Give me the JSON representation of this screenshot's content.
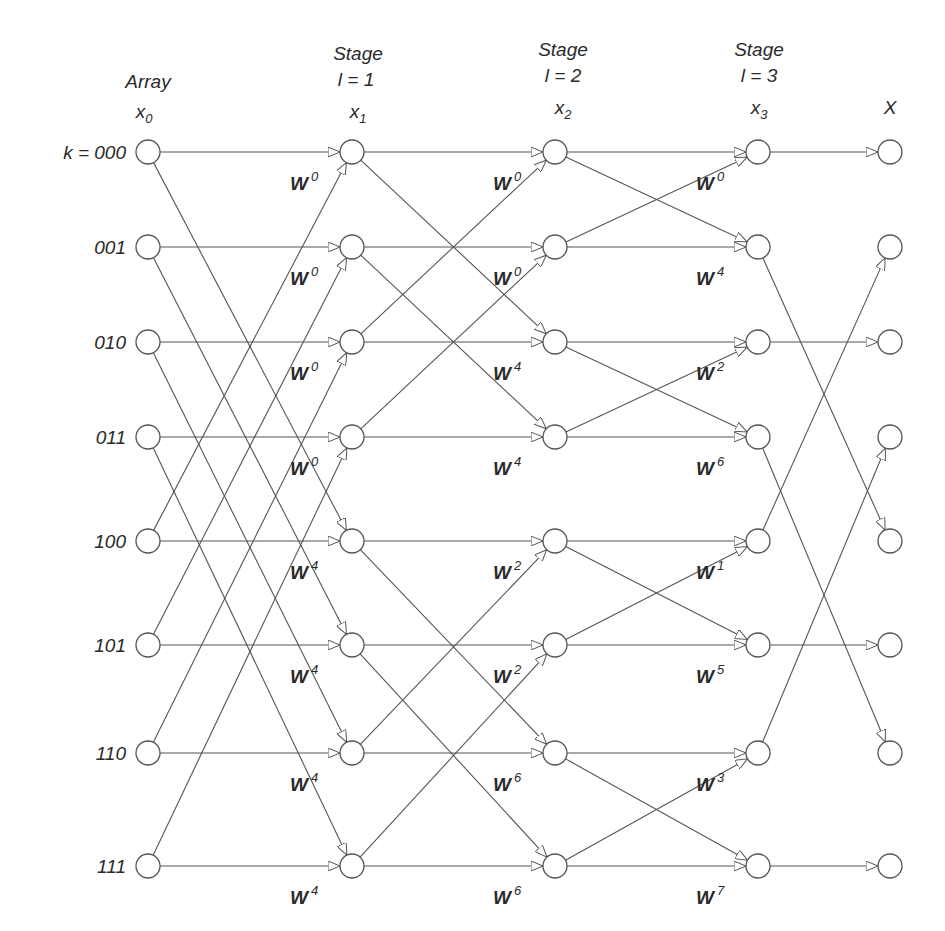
{
  "headers": {
    "array": {
      "line1": "Array",
      "var": "x",
      "sub": "0"
    },
    "stage1": {
      "line1": "Stage",
      "line2": "l = 1",
      "var": "x",
      "sub": "1"
    },
    "stage2": {
      "line1": "Stage",
      "line2": "l = 2",
      "var": "x",
      "sub": "2"
    },
    "stage3": {
      "line1": "Stage",
      "line2": "l = 3",
      "var": "x",
      "sub": "3"
    },
    "output": {
      "var": "X"
    }
  },
  "row_labels": [
    "k = 000",
    "001",
    "010",
    "011",
    "100",
    "101",
    "110",
    "111"
  ],
  "layout": {
    "columns_x": [
      148,
      352,
      555,
      758,
      890
    ],
    "rows_y": [
      152,
      247,
      342,
      437,
      541,
      645,
      753,
      866
    ],
    "node_radius": 12
  },
  "stage1_twiddles": [
    "0",
    "0",
    "0",
    "0",
    "4",
    "4",
    "4",
    "4"
  ],
  "stage2_twiddles": [
    "0",
    "0",
    "4",
    "4",
    "2",
    "2",
    "6",
    "6"
  ],
  "stage3_twiddles": [
    "0",
    "4",
    "2",
    "6",
    "1",
    "5",
    "3",
    "7"
  ],
  "twiddle_base": "W",
  "output_bit_reversal": [
    0,
    4,
    2,
    6,
    1,
    5,
    3,
    7
  ]
}
